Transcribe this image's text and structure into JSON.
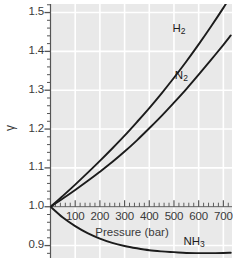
{
  "chart_data": {
    "type": "line",
    "title": "",
    "subtitle": "",
    "xlabel": "Pressure (bar)",
    "ylabel": "γ",
    "xlim": [
      0,
      735
    ],
    "ylim": [
      0.868,
      1.522
    ],
    "grid": true,
    "legend_position": "inline-labels",
    "xticks": [
      100,
      200,
      300,
      400,
      500,
      600,
      700
    ],
    "xticklabels": [
      "100",
      "200",
      "300",
      "400",
      "500",
      "600",
      "700"
    ],
    "xminortick_step": 20,
    "yticks": [
      0.9,
      1.0,
      1.1,
      1.2,
      1.3,
      1.4,
      1.5
    ],
    "yticklabels": [
      "0.9",
      "1.0",
      "1.1",
      "1.2",
      "1.3",
      "1.4",
      "1.5"
    ],
    "yminortick_step": 0.02,
    "gridlines_x": [
      100,
      200,
      300,
      400,
      500,
      600,
      700
    ],
    "gridlines_y": [
      0.9,
      1.0,
      1.1,
      1.2,
      1.3,
      1.4,
      1.5
    ],
    "background_color": "#e9e9e9",
    "gridline_color": "#ffffff",
    "curve_color": "#1c1c1c",
    "axis_color": "#555555",
    "series": [
      {
        "name": "H₂",
        "label_html": "H<sub>2</sub>",
        "color": "#1c1c1c",
        "x": [
          0,
          50,
          100,
          150,
          200,
          250,
          300,
          350,
          400,
          450,
          500,
          550,
          600,
          650,
          700,
          730
        ],
        "y": [
          1.0,
          1.028,
          1.057,
          1.087,
          1.118,
          1.15,
          1.183,
          1.218,
          1.254,
          1.292,
          1.332,
          1.374,
          1.418,
          1.464,
          1.512,
          1.543
        ]
      },
      {
        "name": "N₂",
        "label_html": "N<sub>2</sub>",
        "color": "#1c1c1c",
        "x": [
          0,
          50,
          100,
          150,
          200,
          250,
          300,
          350,
          400,
          450,
          500,
          550,
          600,
          650,
          700,
          730
        ],
        "y": [
          1.0,
          1.021,
          1.043,
          1.066,
          1.09,
          1.115,
          1.142,
          1.171,
          1.202,
          1.234,
          1.268,
          1.303,
          1.34,
          1.378,
          1.417,
          1.441
        ]
      },
      {
        "name": "NH₃",
        "label_html": "NH<sub>3</sub>",
        "color": "#1c1c1c",
        "x": [
          0,
          50,
          100,
          150,
          200,
          250,
          300,
          350,
          400,
          450,
          500,
          550,
          600,
          650,
          700,
          730
        ],
        "y": [
          1.0,
          0.972,
          0.95,
          0.932,
          0.918,
          0.907,
          0.899,
          0.893,
          0.888,
          0.885,
          0.883,
          0.881,
          0.8805,
          0.8805,
          0.881,
          0.8815
        ]
      }
    ],
    "annotations": [
      {
        "text": "H₂",
        "x": 530,
        "y": 1.455
      },
      {
        "text": "N₂",
        "x": 540,
        "y": 1.335
      },
      {
        "text": "NH₃",
        "x": 575,
        "y": 0.906
      }
    ]
  },
  "axis": {
    "y_title": "γ",
    "x_title": "Pressure (bar)"
  }
}
